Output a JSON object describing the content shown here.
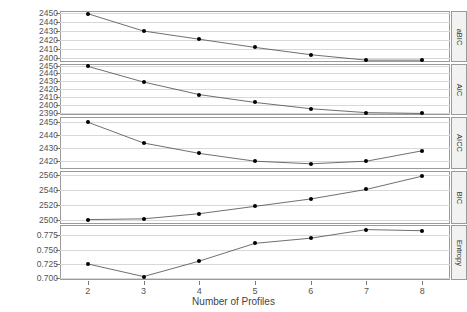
{
  "chart_data": {
    "type": "line",
    "title": "",
    "xlabel": "Number of Profiles",
    "ylabel": "",
    "grid": true,
    "legend": "none",
    "x": [
      2,
      3,
      4,
      5,
      6,
      7,
      8
    ],
    "xlim": [
      1.5,
      8.5
    ],
    "xticks": [
      "2",
      "3",
      "4",
      "5",
      "6",
      "7",
      "8"
    ],
    "panels": [
      {
        "name": "aBIC",
        "ylim": [
          2396,
          2452
        ],
        "yticks": [
          2450,
          2440,
          2430,
          2420,
          2410,
          2400
        ],
        "yticklabels": [
          "2450",
          "2440",
          "2430",
          "2420",
          "2410",
          "2400"
        ],
        "values": [
          2449,
          2430,
          2421,
          2412,
          2404,
          2398,
          2398
        ]
      },
      {
        "name": "AIC",
        "ylim": [
          2387,
          2452
        ],
        "yticks": [
          2450,
          2440,
          2430,
          2420,
          2410,
          2400,
          2390
        ],
        "yticklabels": [
          "2450",
          "2440",
          "2430",
          "2420",
          "2410",
          "2400",
          "2390"
        ],
        "values": [
          2449,
          2429,
          2413,
          2403,
          2395,
          2390,
          2389
        ]
      },
      {
        "name": "AICC",
        "ylim": [
          2414,
          2454
        ],
        "yticks": [
          2450,
          2440,
          2430,
          2420
        ],
        "yticklabels": [
          "2450",
          "2440",
          "2430",
          "2420"
        ],
        "values": [
          2450,
          2434,
          2426,
          2420,
          2418,
          2420,
          2428
        ]
      },
      {
        "name": "BIC",
        "ylim": [
          2494,
          2566
        ],
        "yticks": [
          2560,
          2540,
          2520,
          2500
        ],
        "yticklabels": [
          "2560",
          "2540",
          "2520",
          "2500"
        ],
        "values": [
          2500,
          2501,
          2508,
          2518,
          2528,
          2541,
          2559
        ]
      },
      {
        "name": "Entropy",
        "ylim": [
          0.697,
          0.793
        ],
        "yticks": [
          0.775,
          0.75,
          0.725,
          0.7
        ],
        "yticklabels": [
          "0.775",
          "0.750",
          "0.725",
          "0.700"
        ],
        "values": [
          0.725,
          0.703,
          0.73,
          0.761,
          0.77,
          0.785,
          0.783
        ]
      }
    ]
  }
}
